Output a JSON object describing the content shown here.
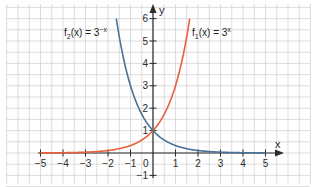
{
  "chart_data": {
    "type": "line",
    "title": "",
    "xlabel": "x",
    "ylabel": "y",
    "xlim": [
      -5,
      5
    ],
    "ylim": [
      -1,
      6
    ],
    "grid": true,
    "grid_step": 0.5,
    "x_ticks": [
      -5,
      -4,
      -3,
      -2,
      -1,
      1,
      2,
      3,
      4,
      5
    ],
    "y_ticks": [
      -1,
      1,
      2,
      3,
      4,
      5,
      6
    ],
    "origin_label": "0",
    "series": [
      {
        "name": "f1(x) = 3^x",
        "label_main": "f",
        "label_sub": "1",
        "label_rest": "(x) = 3",
        "label_sup": "x",
        "color": "#e8603c",
        "formula": "3^x",
        "x": [
          -5,
          -4,
          -3,
          -2,
          -1,
          0,
          0.5,
          1,
          1.5,
          1.63
        ],
        "y": [
          0.004,
          0.012,
          0.037,
          0.111,
          0.333,
          1,
          1.732,
          3,
          5.196,
          6.0
        ]
      },
      {
        "name": "f2(x) = 3^-x",
        "label_main": "f",
        "label_sub": "2",
        "label_rest": "(x) = 3",
        "label_sup": "−x",
        "color": "#4a7196",
        "formula": "3^-x",
        "x": [
          -1.63,
          -1.5,
          -1,
          -0.5,
          0,
          1,
          2,
          3,
          4,
          5
        ],
        "y": [
          6.0,
          5.196,
          3,
          1.732,
          1,
          0.333,
          0.111,
          0.037,
          0.012,
          0.004
        ]
      }
    ]
  }
}
